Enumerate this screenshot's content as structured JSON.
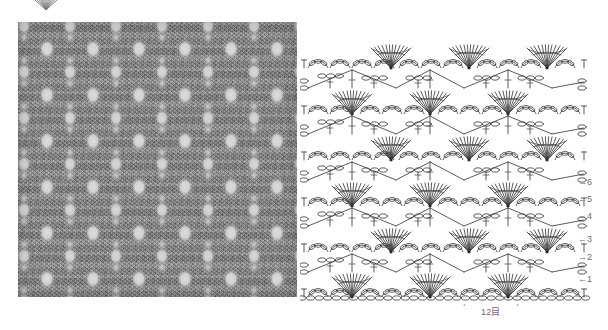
{
  "page": {
    "kind": "crochet-stitch-pattern-sheet",
    "background_color": "#ffffff"
  },
  "top_motif": {
    "icon": "fan-shell-motif-icon",
    "description": "partial fan motif cropped at top page edge"
  },
  "swatch": {
    "name": "crochet-fabric-photo",
    "alt": "grey lace crochet fabric swatch with diamond openwork holes",
    "base_color": "#8e8e8e",
    "hole_color": "#d8d8d8"
  },
  "chart": {
    "ink_color": "#3d3d3d",
    "rows": [
      {
        "number": "1",
        "arrow": "←",
        "arrow_dir": "left",
        "label": "←1"
      },
      {
        "number": "2",
        "arrow": "→",
        "arrow_dir": "right",
        "label": "→2"
      },
      {
        "number": "3",
        "arrow": "←",
        "arrow_dir": "left",
        "label": "←3"
      },
      {
        "number": "4",
        "arrow": "→",
        "arrow_dir": "right",
        "label": "→4"
      },
      {
        "number": "5",
        "arrow": "←",
        "arrow_dir": "left",
        "label": "←5"
      },
      {
        "number": "6",
        "arrow": "→",
        "arrow_dir": "right",
        "label": "→6"
      }
    ],
    "foundation": {
      "count_label": "12目",
      "count": 12,
      "unit": "目",
      "bracket": "span-brace"
    },
    "symbols": {
      "chain": "chain-stitch-oval",
      "double_crochet": "double-crochet-bar",
      "fan": "fan-shell-cluster",
      "arc": "chain-arc-loop"
    }
  }
}
